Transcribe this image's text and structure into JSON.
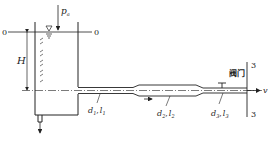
{
  "diagram": {
    "type": "fluid-mechanics-schematic",
    "labels": {
      "atm_pressure": "p",
      "atm_pressure_sub": "a",
      "section0_left": "0",
      "section0_right": "0",
      "head": "H",
      "pipe1_d": "d",
      "pipe1_d_sub": "1",
      "pipe1_l": "l",
      "pipe1_l_sub": "1",
      "pipe2_d": "d",
      "pipe2_d_sub": "2",
      "pipe2_l": "l",
      "pipe2_l_sub": "2",
      "pipe3_d": "d",
      "pipe3_d_sub": "3",
      "pipe3_l": "l",
      "pipe3_l_sub": "3",
      "valve": "阀门",
      "velocity": "v",
      "section3_top": "3",
      "section3_bottom": "3",
      "comma": ","
    },
    "colors": {
      "line": "#222222",
      "background": "#ffffff"
    }
  }
}
